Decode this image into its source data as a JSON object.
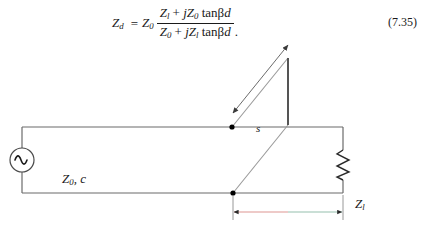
{
  "equation": {
    "lhs_symbol": "Z",
    "lhs_sub": "d",
    "equals": "=",
    "prefactor_symbol": "Z",
    "prefactor_sub": "0",
    "numerator": "Zₗ + jZ₀ tan βd",
    "denominator": "Z₀ + jZₗ tan βd",
    "num_parts": {
      "a_symbol": "Z",
      "a_sub": "l",
      "plus": "+",
      "b_j": "j",
      "b_symbol": "Z",
      "b_sub": "0",
      "tan": "tan",
      "beta": "β",
      "d": "d"
    },
    "den_parts": {
      "a_symbol": "Z",
      "a_sub": "0",
      "plus": "+",
      "b_j": "j",
      "b_symbol": "Z",
      "b_sub": "l",
      "tan": "tan",
      "beta": "β",
      "d": "d"
    },
    "trailing_period": ".",
    "number": "(7.35)"
  },
  "diagram": {
    "source_symbol": "∼",
    "line_label": "Z₀, c",
    "line_label_parts": {
      "z": "Z",
      "sub": "0",
      "comma": ",",
      "c": "c"
    },
    "load_label": "Zₗ",
    "load_label_parts": {
      "z": "Z",
      "sub": "l"
    },
    "stub_length_label": "s",
    "distance_label": "d",
    "origin_label": "0",
    "colors": {
      "wire": "#6b6b6b",
      "stub": "#8c8c8c",
      "node": "#000000",
      "stub_end": "#555555",
      "dim_left": "#e8b9b6",
      "dim_right": "#b9d4c8",
      "dim_tick": "#2a2a2a"
    },
    "geometry": {
      "top_rail_y": 87,
      "bottom_rail_y": 153,
      "left_x": 22,
      "right_x": 343,
      "node_top_x": 232,
      "node_bottom_x": 233,
      "stub_end_x": 288,
      "dim_y": 212
    }
  }
}
